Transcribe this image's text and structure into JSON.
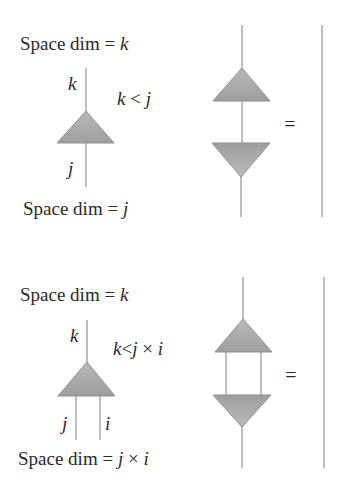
{
  "colors": {
    "background": "#ffffff",
    "wire": "#9c9c9c",
    "triangle_fill_light": "#bdbdbd",
    "triangle_fill_dark": "#9a9a9a",
    "triangle_edge": "#8f8f8f",
    "text": "#2a2a2a"
  },
  "panel1": {
    "top_label_prefix": "Space dim = ",
    "top_label_var": "k",
    "bottom_label_prefix": "Space dim = ",
    "bottom_label_var": "j",
    "upper_index": "k",
    "lower_index": "j",
    "condition_k": "k",
    "condition_op": " < ",
    "condition_j": "j",
    "equals": "="
  },
  "panel2": {
    "top_label_prefix": "Space dim = ",
    "top_label_var": "k",
    "bottom_label_prefix": "Space dim = ",
    "bottom_label_var1": "j",
    "bottom_label_times": " × ",
    "bottom_label_var2": "i",
    "upper_index": "k",
    "lower_index_left": "j",
    "lower_index_right": "i",
    "condition_k": "k",
    "condition_op": "<",
    "condition_j": "j",
    "condition_times": " × ",
    "condition_i": "i",
    "equals": "="
  }
}
